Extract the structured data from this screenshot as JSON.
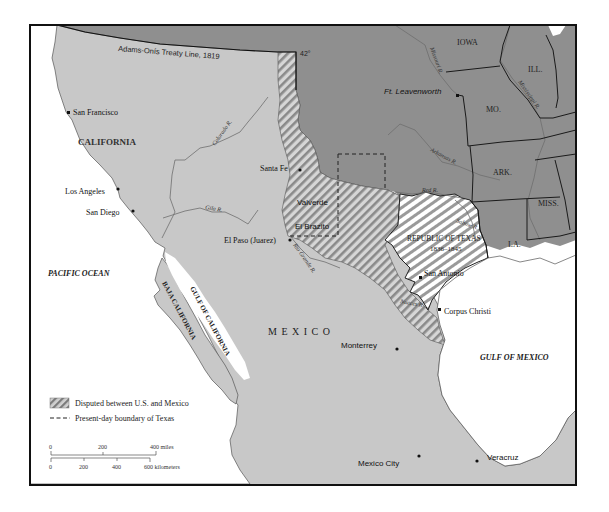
{
  "map": {
    "colors": {
      "us_territory": "#8f8f8f",
      "mexico_territory": "#c8c8c8",
      "water": "#ffffff",
      "frame": "#111111",
      "texas_stripe_light": "#ffffff",
      "hatch_dark": "#8a8a8a"
    },
    "boundary_labels": {
      "treaty_line": "Adams-Onís Treaty Line, 1819",
      "latitude": "42°"
    },
    "regions": {
      "california": "CALIFORNIA",
      "mexico": "M E X I C O",
      "republic_of_texas": "REPUBLIC OF TEXAS",
      "republic_of_texas_years": "1836–1845",
      "baja_california": "BAJA CALIFORNIA",
      "iowa": "IOWA",
      "illinois": "ILL.",
      "missouri": "MO.",
      "arkansas": "ARK.",
      "mississippi": "MISS.",
      "louisiana": "LA."
    },
    "water_bodies": {
      "pacific": "PACIFIC OCEAN",
      "gulf_of_mexico": "GULF OF MEXICO",
      "gulf_of_california": "GULF OF CALIFORNIA"
    },
    "rivers": {
      "colorado": "Colorado R.",
      "gila": "Gila R.",
      "rio_grande": "Rio Grande R.",
      "nueces": "Nueces R.",
      "red": "Red R.",
      "arkansas": "Arkansas R.",
      "sabine": "Sabine R.",
      "missouri": "Missouri R.",
      "mississippi": "Mississippi R."
    },
    "cities": [
      {
        "name": "San Francisco"
      },
      {
        "name": "Los Angeles"
      },
      {
        "name": "San Diego"
      },
      {
        "name": "Santa Fe"
      },
      {
        "name": "Valverde"
      },
      {
        "name": "El Brazito"
      },
      {
        "name": "El Paso (Juarez)"
      },
      {
        "name": "Ft. Leavenworth"
      },
      {
        "name": "San Antonio"
      },
      {
        "name": "Corpus Christi"
      },
      {
        "name": "Monterrey"
      },
      {
        "name": "Mexico City"
      },
      {
        "name": "Veracruz"
      }
    ],
    "legend": {
      "disputed": "Disputed between U.S. and Mexico",
      "present_boundary": "Present-day boundary of Texas"
    },
    "scale": {
      "miles": [
        "0",
        "200",
        "400 miles"
      ],
      "kilometers": [
        "0",
        "200",
        "400",
        "600 kilometers"
      ]
    }
  }
}
